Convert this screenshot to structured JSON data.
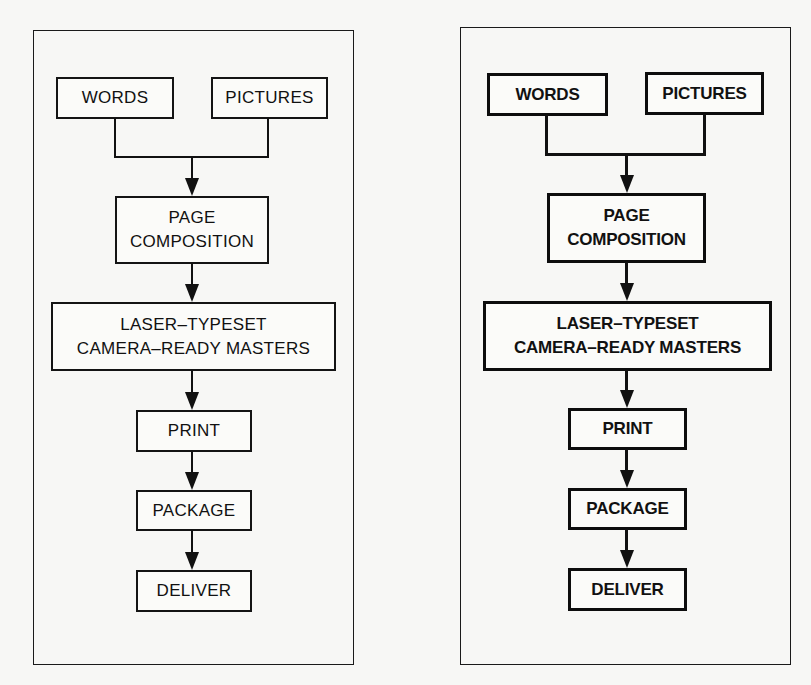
{
  "diagrams": [
    {
      "name": "left",
      "style": "regular",
      "nodes": {
        "words": "WORDS",
        "pictures": "PICTURES",
        "page_composition": "PAGE\nCOMPOSITION",
        "laser_typeset": "LASER–TYPESET\nCAMERA–READY MASTERS",
        "print": "PRINT",
        "package": "PACKAGE",
        "deliver": "DELIVER"
      }
    },
    {
      "name": "right",
      "style": "bold",
      "nodes": {
        "words": "WORDS",
        "pictures": "PICTURES",
        "page_composition": "PAGE\nCOMPOSITION",
        "laser_typeset": "LASER–TYPESET\nCAMERA–READY MASTERS",
        "print": "PRINT",
        "package": "PACKAGE",
        "deliver": "DELIVER"
      }
    }
  ],
  "edges": [
    [
      "WORDS",
      "PAGE COMPOSITION"
    ],
    [
      "PICTURES",
      "PAGE COMPOSITION"
    ],
    [
      "PAGE COMPOSITION",
      "LASER-TYPESET CAMERA-READY MASTERS"
    ],
    [
      "LASER-TYPESET CAMERA-READY MASTERS",
      "PRINT"
    ],
    [
      "PRINT",
      "PACKAGE"
    ],
    [
      "PACKAGE",
      "DELIVER"
    ]
  ],
  "colors": {
    "ink": "#111111",
    "paper": "#f7f7f5"
  }
}
